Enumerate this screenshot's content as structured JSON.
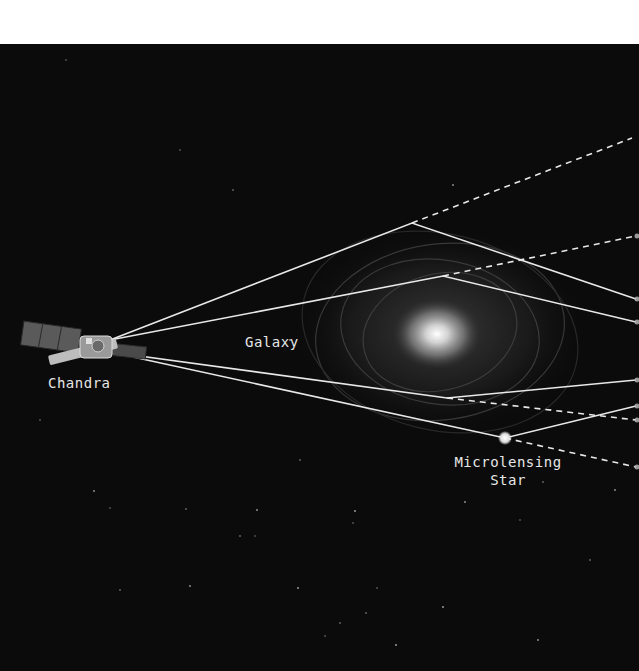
{
  "diagram": {
    "background_color": "#0b0b0b",
    "line_color": "#e8e8e8",
    "labels": {
      "telescope": "Chandra",
      "galaxy": "Galaxy",
      "microlens_line1": "Microlensing",
      "microlens_line2": "Star"
    },
    "objects": {
      "telescope": {
        "name": "Chandra",
        "icon": "satellite-icon",
        "x": 80,
        "y": 345
      },
      "galaxy": {
        "name": "Galaxy",
        "core_x": 437,
        "core_y": 334
      },
      "microlensing_star": {
        "name": "Microlensing Star",
        "x": 505,
        "y": 438
      }
    },
    "light_paths": [
      {
        "id": "path-1",
        "from": [
          110,
          340
        ],
        "bend": [
          412,
          223
        ],
        "solid_to": [
          636,
          299
        ],
        "dashed_to": [
          632,
          138
        ]
      },
      {
        "id": "path-2",
        "from": [
          110,
          340
        ],
        "bend": [
          443,
          276
        ],
        "solid_to": [
          636,
          322
        ],
        "dashed_to": [
          636,
          236
        ]
      },
      {
        "id": "path-3",
        "from": [
          110,
          352
        ],
        "bend": [
          447,
          398
        ],
        "solid_to": [
          636,
          380
        ],
        "dashed_to": [
          636,
          420
        ]
      },
      {
        "id": "path-4",
        "from": [
          110,
          352
        ],
        "bend": [
          505,
          438
        ],
        "solid_to": [
          636,
          406
        ],
        "dashed_to": [
          636,
          467
        ]
      }
    ]
  }
}
